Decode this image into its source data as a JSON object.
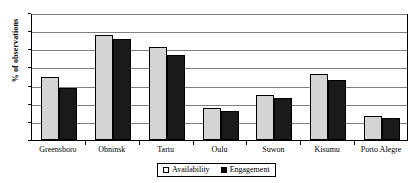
{
  "chart_data": {
    "type": "bar",
    "title": "",
    "xlabel": "",
    "ylabel": "% of observations",
    "ylim": [
      0,
      14
    ],
    "ytick_step": 2,
    "yticks": [
      "0",
      "2",
      "4",
      "6",
      "8",
      "10",
      "12",
      "14"
    ],
    "grid": true,
    "legend_position": "bottom-center",
    "categories": [
      "Greensboro",
      "Obninsk",
      "Tartu",
      "Oulu",
      "Suwon",
      "Kisumu",
      "Porto Alegre"
    ],
    "series": [
      {
        "name": "Availability",
        "color": "#d4d4d4",
        "values": [
          6.9,
          11.6,
          10.2,
          3.5,
          5.0,
          7.3,
          2.7
        ]
      },
      {
        "name": "Engagement",
        "color": "#1a1a1a",
        "values": [
          5.7,
          11.1,
          9.4,
          3.2,
          4.6,
          6.6,
          2.4
        ]
      }
    ]
  },
  "legend": {
    "items": [
      {
        "label": "Availability",
        "swatch": "avail"
      },
      {
        "label": "Engagement",
        "swatch": "engage"
      }
    ]
  }
}
